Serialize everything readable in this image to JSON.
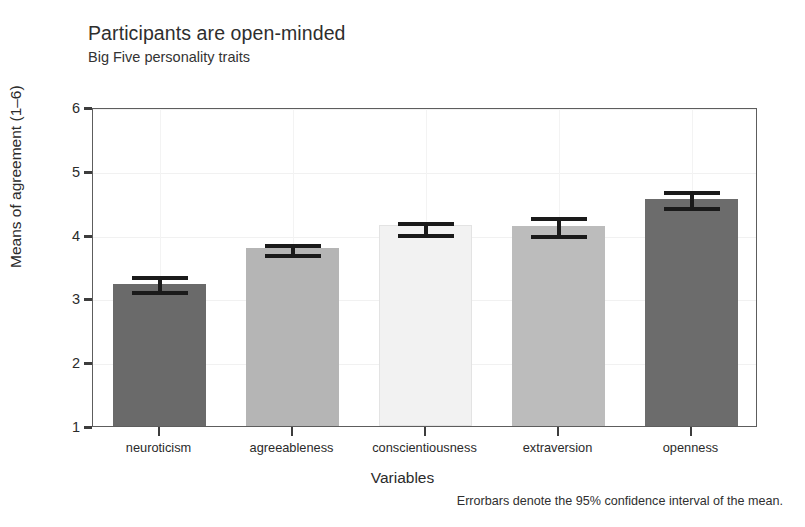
{
  "chart_data": {
    "type": "bar",
    "title": "Participants are open-minded",
    "subtitle": "Big Five personality traits",
    "xlabel": "Variables",
    "ylabel": "Means of agreement (1–6)",
    "categories": [
      "neuroticism",
      "agreeableness",
      "conscientiousness",
      "extraversion",
      "openness"
    ],
    "values": [
      3.23,
      3.79,
      4.15,
      4.13,
      4.56
    ],
    "error_low": [
      3.08,
      3.67,
      3.98,
      3.97,
      4.4
    ],
    "error_high": [
      3.38,
      3.89,
      4.23,
      4.31,
      4.72
    ],
    "ylim": [
      1,
      6
    ],
    "yticks": [
      1,
      2,
      3,
      4,
      5,
      6
    ],
    "ytick_labels": [
      "1",
      "2",
      "3",
      "4",
      "5",
      "6"
    ],
    "bar_colors": [
      "#6a6a6a",
      "#b5b5b5",
      "#f2f2f2",
      "#bcbcbc",
      "#6c6c6c"
    ],
    "errorbar_color": "#1a1a1a",
    "grid": true,
    "legend": "none",
    "caption": "Errorbars denote the 95% confidence interval of the mean."
  }
}
